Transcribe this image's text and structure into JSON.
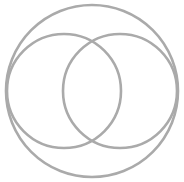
{
  "diagram": {
    "type": "venn-in-circle",
    "stroke_color": "#aaaaaa",
    "background": "#ffffff",
    "outer_circle": {
      "cx": 92,
      "cy": 91,
      "r": 86
    },
    "inner_circles": [
      {
        "name": "left",
        "cx": 64,
        "cy": 91,
        "r": 57
      },
      {
        "name": "right",
        "cx": 120,
        "cy": 91,
        "r": 57
      }
    ]
  }
}
